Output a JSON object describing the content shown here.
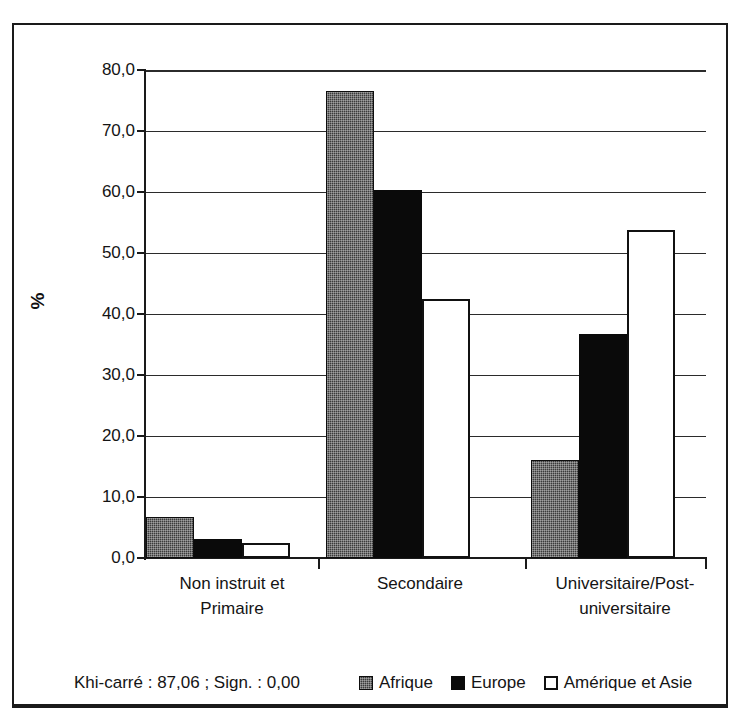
{
  "chart_data": {
    "type": "bar",
    "title": "",
    "xlabel": "",
    "ylabel": "%",
    "ylim": [
      0,
      80
    ],
    "ytick_step": 10,
    "ytick_labels": [
      "0,0",
      "10,0",
      "20,0",
      "30,0",
      "40,0",
      "50,0",
      "60,0",
      "70,0",
      "80,0"
    ],
    "ytick_values": [
      0,
      10,
      20,
      30,
      40,
      50,
      60,
      70,
      80
    ],
    "grid": true,
    "legend_position": "bottom-right",
    "categories": [
      "Non instruit et\nPrimaire",
      "Secondaire",
      "Universitaire/Post-\nuniversitaire"
    ],
    "categories_display": [
      [
        "Non instruit et",
        "Primaire"
      ],
      [
        "Secondaire",
        ""
      ],
      [
        "Universitaire/Post-",
        "universitaire"
      ]
    ],
    "series": [
      {
        "name": "Afrique",
        "values": [
          6.8,
          76.5,
          16.1
        ],
        "color": "#3b3b3b",
        "fill": "hatched-dark"
      },
      {
        "name": "Europe",
        "values": [
          3.1,
          60.3,
          36.8
        ],
        "color": "#0a0a0a",
        "fill": "solid-black"
      },
      {
        "name": "Amérique et Asie",
        "values": [
          2.5,
          42.5,
          53.8
        ],
        "color": "#ffffff",
        "fill": "white-outlined"
      }
    ],
    "annotations": [
      "Khi-carré : 87,06 ; Sign. : 0,00"
    ]
  },
  "axis": {
    "y_title": "%"
  },
  "footer": {
    "stats_text": "Khi-carré : 87,06 ; Sign. : 0,00"
  },
  "legend": {
    "items": [
      {
        "label": "Afrique"
      },
      {
        "label": "Europe"
      },
      {
        "label": "Amérique et Asie"
      }
    ]
  }
}
